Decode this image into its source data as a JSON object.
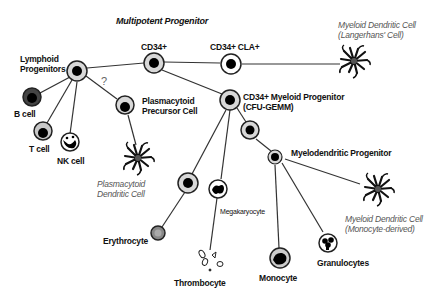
{
  "diagram": {
    "title": "Multipotent Progenitor",
    "nodes": {
      "cd34": {
        "label": "CD34+"
      },
      "cd34_cla": {
        "label": "CD34+ CLA+"
      },
      "langerhans": {
        "label_line1": "Myeloid Dendritic Cell",
        "label_line2": "(Langerhans' Cell)"
      },
      "lymphoid": {
        "label_line1": "Lymphoid",
        "label_line2": "Progenitors"
      },
      "b_cell": {
        "label": "B cell"
      },
      "t_cell": {
        "label": "T cell"
      },
      "nk_cell": {
        "label": "NK cell"
      },
      "plasmacytoid_precursor": {
        "label_line1": "Plasmacytoid",
        "label_line2": "Precursor Cell"
      },
      "uncertain_marker": {
        "label": "?"
      },
      "plasmacytoid_dc": {
        "label_line1": "Plasmacytoid",
        "label_line2": "Dendritic Cell"
      },
      "myeloid_progenitor": {
        "label_line1": "CD34+ Myeloid Progenitor",
        "label_line2": "(CFU-GEMM)"
      },
      "myelodendritic": {
        "label": "Myelodendritic Progenitor"
      },
      "megakaryocyte": {
        "label": "Megakaryocyte"
      },
      "erythrocyte": {
        "label": "Erythrocyte"
      },
      "thrombocyte": {
        "label": "Thrombocyte"
      },
      "monocyte": {
        "label": "Monocyte"
      },
      "granulocytes": {
        "label": "Granulocytes"
      },
      "monocyte_dc": {
        "label_line1": "Myeloid Dendritic Cell",
        "label_line2": "(Monocyte-derived)"
      }
    },
    "colors": {
      "line": "#333333",
      "cell_outline": "#222222",
      "nucleus": "#000000",
      "cytoplasm": "#d8d8d8",
      "b_cell_fill": "#444444",
      "erythrocyte_fill": "#888888",
      "italic_label": "#555555"
    }
  }
}
